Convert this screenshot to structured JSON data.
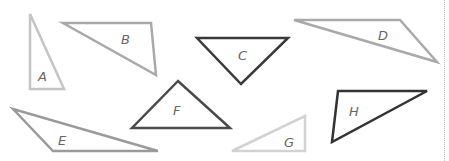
{
  "diagram": {
    "triangles": [
      {
        "label": "A",
        "points": "30,14 30,89 64,89",
        "stroke": "#c4c4c4",
        "width": 2.5,
        "lx": 38,
        "ly": 81
      },
      {
        "label": "B",
        "points": "63,23 151,23 156,75",
        "stroke": "#a9a9a9",
        "width": 2.5,
        "lx": 121,
        "ly": 44
      },
      {
        "label": "C",
        "points": "197,38 288,38 241,84",
        "stroke": "#3a3a3a",
        "width": 2.5,
        "lx": 238,
        "ly": 60
      },
      {
        "label": "D",
        "points": "294,20 400,20 437,62",
        "stroke": "#a9a9a9",
        "width": 2.5,
        "lx": 378,
        "ly": 40
      },
      {
        "label": "E",
        "points": "13,109 53,151 158,151",
        "stroke": "#9a9a9a",
        "width": 2.5,
        "lx": 58,
        "ly": 145
      },
      {
        "label": "F",
        "points": "178,81 132,128 230,128",
        "stroke": "#4a4a4a",
        "width": 2.5,
        "lx": 173,
        "ly": 115
      },
      {
        "label": "G",
        "points": "232,151 305,116 305,151",
        "stroke": "#d2d2d2",
        "width": 2.5,
        "lx": 284,
        "ly": 147
      },
      {
        "label": "H",
        "points": "338,91 427,91 332,142",
        "stroke": "#333333",
        "width": 2.5,
        "lx": 349,
        "ly": 116
      }
    ]
  }
}
